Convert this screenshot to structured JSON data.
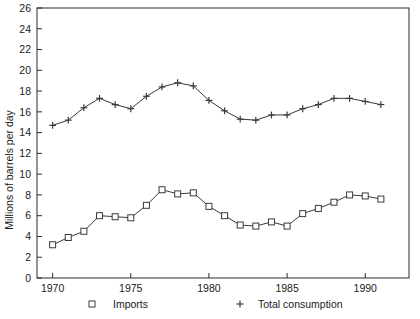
{
  "chart_data": {
    "type": "line",
    "title": "",
    "xlabel": "",
    "ylabel": "Millions of barrels per day",
    "xlim": [
      1969.0,
      1992.8
    ],
    "ylim": [
      0,
      26
    ],
    "grid": false,
    "legend_position": "below-axis",
    "y_ticks": [
      0,
      2,
      4,
      6,
      8,
      10,
      12,
      14,
      16,
      18,
      20,
      22,
      24,
      26
    ],
    "y_tick_labels": [
      "0",
      "2",
      "4",
      "6",
      "8",
      "10",
      "12",
      "14",
      "16",
      "18",
      "20",
      "22",
      "24",
      "26"
    ],
    "x_ticks": [
      1970,
      1975,
      1980,
      1985,
      1990
    ],
    "x_tick_labels": [
      "1970",
      "1975",
      "1980",
      "1985",
      "1990"
    ],
    "x": [
      1970,
      1971,
      1972,
      1973,
      1974,
      1975,
      1976,
      1977,
      1978,
      1979,
      1980,
      1981,
      1982,
      1983,
      1984,
      1985,
      1986,
      1987,
      1988,
      1989,
      1990,
      1991
    ],
    "series": [
      {
        "name": "Imports",
        "marker": "square",
        "values": [
          3.2,
          3.9,
          4.5,
          6.0,
          5.9,
          5.8,
          7.0,
          8.5,
          8.1,
          8.2,
          6.9,
          6.0,
          5.1,
          5.0,
          5.4,
          5.0,
          6.2,
          6.7,
          7.3,
          8.0,
          7.9,
          7.6
        ]
      },
      {
        "name": "Total consumption",
        "marker": "plus",
        "values": [
          14.7,
          15.2,
          16.4,
          17.3,
          16.7,
          16.3,
          17.5,
          18.4,
          18.8,
          18.5,
          17.1,
          16.1,
          15.3,
          15.2,
          15.7,
          15.7,
          16.3,
          16.7,
          17.3,
          17.3,
          17.0,
          16.7
        ]
      }
    ],
    "legend": [
      {
        "label": "Imports",
        "marker": "square"
      },
      {
        "label": "Total consumption",
        "marker": "plus"
      }
    ],
    "colors": {
      "line": "#3a3a3a",
      "axis": "#2b2b2b",
      "background": "#ffffff"
    }
  }
}
